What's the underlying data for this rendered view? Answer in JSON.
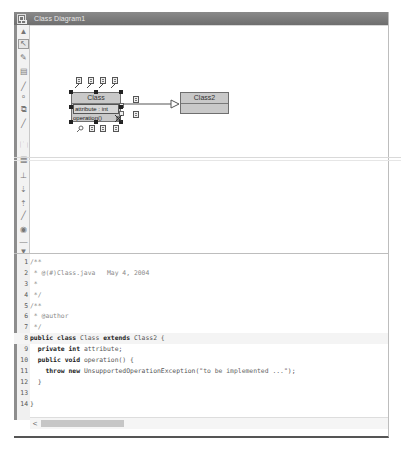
{
  "window": {
    "title": "Class Diagram1",
    "icon": "diagram-window-icon"
  },
  "toolbar": {
    "tools": [
      {
        "name": "scroll-up",
        "icon": "triangle-up-icon",
        "glyph": "▲"
      },
      {
        "name": "select",
        "icon": "pointer-arrow-icon",
        "glyph": "↖",
        "selected": true
      },
      {
        "name": "note",
        "icon": "eraser-icon",
        "glyph": "✎"
      },
      {
        "name": "class",
        "icon": "class-box-icon",
        "glyph": "▤"
      },
      {
        "name": "line",
        "icon": "line-icon",
        "glyph": "╱"
      },
      {
        "name": "interface",
        "icon": "lollipop-icon",
        "glyph": "ᵒ"
      },
      {
        "name": "package-class",
        "icon": "class-stack-icon",
        "glyph": "⧉"
      },
      {
        "name": "association",
        "icon": "line-icon",
        "glyph": "╱"
      },
      {
        "name": "package",
        "icon": "folder-icon",
        "glyph": "🗀"
      },
      {
        "name": "table",
        "icon": "table-icon",
        "glyph": "▦"
      },
      {
        "name": "inheritance",
        "icon": "inheritance-icon",
        "glyph": "⊥"
      },
      {
        "name": "dependency",
        "icon": "dependency-icon",
        "glyph": "⇣"
      },
      {
        "name": "realization",
        "icon": "realization-icon",
        "glyph": "⇡"
      },
      {
        "name": "link",
        "icon": "line-icon",
        "glyph": "╱"
      },
      {
        "name": "view",
        "icon": "eye-icon",
        "glyph": "◉"
      },
      {
        "name": "separator",
        "icon": "dash-icon",
        "glyph": "—"
      },
      {
        "name": "scroll-down",
        "icon": "triangle-down-icon",
        "glyph": "▼"
      }
    ]
  },
  "diagram": {
    "classes": [
      {
        "name": "Class",
        "attributes": [
          "attribute : int"
        ],
        "operations": [
          "operation()"
        ],
        "selected": true
      },
      {
        "name": "Class2",
        "attributes": [],
        "operations": []
      }
    ],
    "relation": {
      "type": "generalization",
      "from": "Class",
      "to": "Class2"
    }
  },
  "editor": {
    "lines": [
      {
        "n": "1",
        "parts": [
          {
            "t": "/**",
            "c": "cm"
          }
        ]
      },
      {
        "n": "2",
        "parts": [
          {
            "t": " * @(#)Class.java   May 4, 2004",
            "c": "cm"
          }
        ]
      },
      {
        "n": "3",
        "parts": [
          {
            "t": " *",
            "c": "cm"
          }
        ]
      },
      {
        "n": "4",
        "parts": [
          {
            "t": " */",
            "c": "cm"
          }
        ]
      },
      {
        "n": "5",
        "parts": [
          {
            "t": "/**",
            "c": "cm"
          }
        ]
      },
      {
        "n": "6",
        "parts": [
          {
            "t": " * @author",
            "c": "cm"
          }
        ]
      },
      {
        "n": "7",
        "parts": [
          {
            "t": " */",
            "c": "cm"
          }
        ]
      },
      {
        "n": "8",
        "current": true,
        "parts": [
          {
            "t": "public class ",
            "c": "kw"
          },
          {
            "t": "Class ",
            "c": "tx"
          },
          {
            "t": "extends ",
            "c": "kw"
          },
          {
            "t": "Class2 {",
            "c": "tx"
          }
        ]
      },
      {
        "n": "9",
        "parts": [
          {
            "t": "  private int ",
            "c": "kw"
          },
          {
            "t": "attribute;",
            "c": "tx"
          }
        ]
      },
      {
        "n": "10",
        "parts": [
          {
            "t": "  public void ",
            "c": "kw"
          },
          {
            "t": "operation() {",
            "c": "tx"
          }
        ]
      },
      {
        "n": "11",
        "parts": [
          {
            "t": "    throw new ",
            "c": "kw"
          },
          {
            "t": "UnsupportedOperationException(",
            "c": "tx"
          },
          {
            "t": "\"to be implemented ...\"",
            "c": "st"
          },
          {
            "t": ");",
            "c": "tx"
          }
        ]
      },
      {
        "n": "12",
        "parts": [
          {
            "t": "  }",
            "c": "tx"
          }
        ]
      },
      {
        "n": "13",
        "parts": []
      },
      {
        "n": "14",
        "parts": [
          {
            "t": "}",
            "c": "tx"
          }
        ]
      }
    ],
    "scrollbar": {
      "left_arrow": "<"
    }
  },
  "colors": {
    "titlebar": "#7a7a7a",
    "class_fill": "#c9c9c9",
    "class_border": "#6f6f6f",
    "toolbar_bg": "#f2f2f2"
  }
}
